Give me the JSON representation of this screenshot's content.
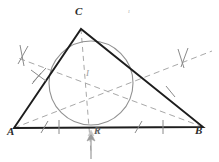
{
  "figure": {
    "background_color": "#ffffff",
    "width": 219,
    "height": 162,
    "colors": {
      "triangle_stroke": "#1d1d1d",
      "circle_stroke": "#8d8d8d",
      "bisector_stroke": "#a0a0a0",
      "tick_stroke": "#8a8a8a",
      "arrow_stroke": "#9b9b9b",
      "label_color": "#2b2b2b",
      "faint_label_color": "#9a9a9a"
    },
    "labels": {
      "vertex_a": "A",
      "vertex_b": "B",
      "vertex_c": "C",
      "incenter": "I",
      "touch_point": "R",
      "stray_mark": "ı"
    },
    "points": {
      "A": {
        "x": 14,
        "y": 128
      },
      "B": {
        "x": 203,
        "y": 127
      },
      "C": {
        "x": 81,
        "y": 29
      },
      "I": {
        "x": 91,
        "y": 83
      },
      "R": {
        "x": 91,
        "y": 127
      }
    },
    "incircle": {
      "cx": 91,
      "cy": 83,
      "r": 42
    },
    "label_positions": {
      "A": {
        "x": 9,
        "y": 131
      },
      "B": {
        "x": 196,
        "y": 130
      },
      "C": {
        "x": 75,
        "y": 8
      },
      "I": {
        "x": 87,
        "y": 72
      },
      "R": {
        "x": 94,
        "y": 129
      },
      "stray": {
        "x": 128,
        "y": 10
      }
    },
    "bisectors": [
      {
        "name": "bisector-from-a",
        "x1": 14,
        "y1": 128,
        "x2": 212,
        "y2": 51
      },
      {
        "name": "bisector-from-b",
        "x1": 203,
        "y1": 127,
        "x2": 18,
        "y2": 58
      },
      {
        "name": "bisector-from-c",
        "x1": 81,
        "y1": 29,
        "x2": 91,
        "y2": 152
      }
    ],
    "side_ticks": [
      {
        "name": "tick-side-ac",
        "x": 36,
        "y": 79,
        "angle": 62
      },
      {
        "name": "tick-side-bc",
        "x": 170,
        "y": 92,
        "angle": -54
      },
      {
        "name": "tick-base-left-a",
        "x": 45,
        "y": 127,
        "angle": 68
      },
      {
        "name": "tick-base-left-b",
        "x": 59,
        "y": 127,
        "angle": 90
      },
      {
        "name": "tick-base-right-a",
        "x": 139,
        "y": 127,
        "angle": 68
      },
      {
        "name": "tick-base-right-b",
        "x": 163,
        "y": 127,
        "angle": 90
      }
    ],
    "bisector_ticks": [
      {
        "name": "double-tick-upper-right-1",
        "x": 181,
        "y": 60,
        "angle": 72
      },
      {
        "name": "double-tick-upper-right-2",
        "x": 186,
        "y": 58,
        "angle": 108
      },
      {
        "name": "double-tick-upper-left-1",
        "x": 22,
        "y": 56,
        "angle": 80
      },
      {
        "name": "double-tick-upper-left-2",
        "x": 26,
        "y": 55,
        "angle": 104
      },
      {
        "name": "tick-lower-left-bisector",
        "x": 40,
        "y": 75,
        "angle": 58
      }
    ],
    "radius_arrow": {
      "name": "radius-arrow",
      "x": 91,
      "y_tail": 158,
      "y_head": 133,
      "head_width": 4,
      "head_length": 6
    }
  }
}
